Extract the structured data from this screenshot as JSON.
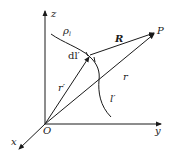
{
  "diagram": {
    "axes": {
      "z_label": "z",
      "y_label": "y",
      "x_label": "x",
      "origin_label": "O"
    },
    "labels": {
      "charge_density": "ρl",
      "charge_density_base": "ρ",
      "charge_density_sub": "l",
      "line_element": "dl′",
      "separation_vector": "R",
      "field_point": "P",
      "source_position": "r′",
      "field_position": "r",
      "line_source": "l′"
    },
    "colors": {
      "stroke": "#1a1a1a",
      "background": "#ffffff"
    }
  }
}
